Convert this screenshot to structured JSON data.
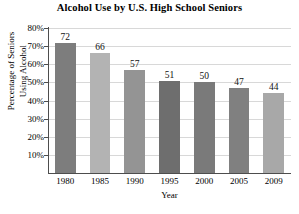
{
  "chart_data": {
    "type": "bar",
    "title": "Alcohol Use by U.S. High School Seniors",
    "xlabel": "Year",
    "ylabel": "Percentage of Seniors Using Alcohol",
    "ylabel_lines": [
      "Percentage of Seniors",
      "Using Alcohol"
    ],
    "categories": [
      "1980",
      "1985",
      "1990",
      "1995",
      "2000",
      "2005",
      "2009"
    ],
    "values": [
      72,
      66,
      57,
      51,
      50,
      47,
      44
    ],
    "data_labels": [
      "72",
      "66",
      "57",
      "51",
      "50",
      "47",
      "44"
    ],
    "ylim": [
      0,
      80
    ],
    "ytick_values": [
      80,
      70,
      60,
      50,
      40,
      30,
      20,
      10
    ],
    "ytick_labels": [
      "80%",
      "70%",
      "60%",
      "50%",
      "40%",
      "30%",
      "20%",
      "10%"
    ],
    "grid": true,
    "legend": false,
    "bar_colors": [
      "#7d7d7d",
      "#b3b3b3",
      "#949494",
      "#6e6e6e",
      "#7a7a7a",
      "#808080",
      "#a8a8a8"
    ],
    "background_color": "#ffffff",
    "axis_color": "#4d4d4d",
    "gridline_color": "#d8d8d8"
  }
}
